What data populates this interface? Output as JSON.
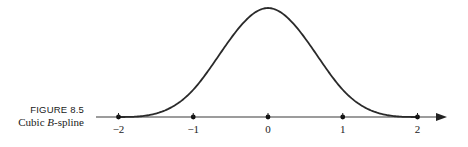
{
  "caption": {
    "figure_number": "FIGURE 8.5",
    "title_prefix": "Cubic ",
    "title_italic": "B",
    "title_suffix": "-spline"
  },
  "chart_data": {
    "type": "line",
    "title": "Cubic B-spline",
    "xlabel": "",
    "ylabel": "",
    "x_ticks": [
      -2,
      -1,
      0,
      1,
      2
    ],
    "tick_labels": [
      "−2",
      "−1",
      "0",
      "1",
      "2"
    ],
    "xlim": [
      -2.3,
      2.35
    ],
    "ylim": [
      0,
      0.6667
    ],
    "grid": false,
    "legend": null,
    "y_axis_shown": false,
    "series": [
      {
        "name": "cubic B-spline",
        "x": [
          -2,
          -1.5,
          -1,
          -0.5,
          0,
          0.5,
          1,
          1.5,
          2
        ],
        "values": [
          0,
          0.0208,
          0.1667,
          0.4792,
          0.6667,
          0.4792,
          0.1667,
          0.0208,
          0
        ]
      }
    ],
    "markers": [
      -2,
      -1,
      0,
      1,
      2
    ],
    "colors": {
      "curve": "#2a2a2a",
      "axis": "#3a3a3a"
    }
  }
}
